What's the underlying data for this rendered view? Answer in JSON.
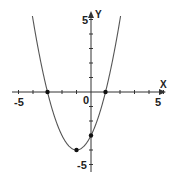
{
  "chart_data": {
    "type": "line",
    "title": "",
    "function": "y = x^2 + 2x - 3",
    "xlabel": "X",
    "ylabel": "Y",
    "xlim": [
      -5,
      5
    ],
    "ylim": [
      -5,
      5
    ],
    "x_tick_labels": [
      "-5",
      "0",
      "5"
    ],
    "y_tick_labels": [
      "5",
      "-5"
    ],
    "grid": false,
    "series": [
      {
        "name": "parabola",
        "x": [
          -4.3,
          -4,
          -3,
          -2,
          -1,
          0,
          1,
          2,
          2.3
        ],
        "values": [
          2.19,
          5,
          0,
          -3,
          -4,
          -3,
          0,
          5,
          7.89
        ]
      }
    ],
    "marked_points": [
      {
        "x": -3,
        "y": 0
      },
      {
        "x": 1,
        "y": 0
      },
      {
        "x": -1,
        "y": -4
      },
      {
        "x": 0,
        "y": -3
      }
    ]
  },
  "labels": {
    "x_axis": "X",
    "y_axis": "Y",
    "x_min": "-5",
    "x_origin": "0",
    "x_max": "5",
    "y_max": "5",
    "y_min": "-5"
  },
  "colors": {
    "axis": "#333333",
    "curve": "#555555",
    "point": "#111111"
  }
}
